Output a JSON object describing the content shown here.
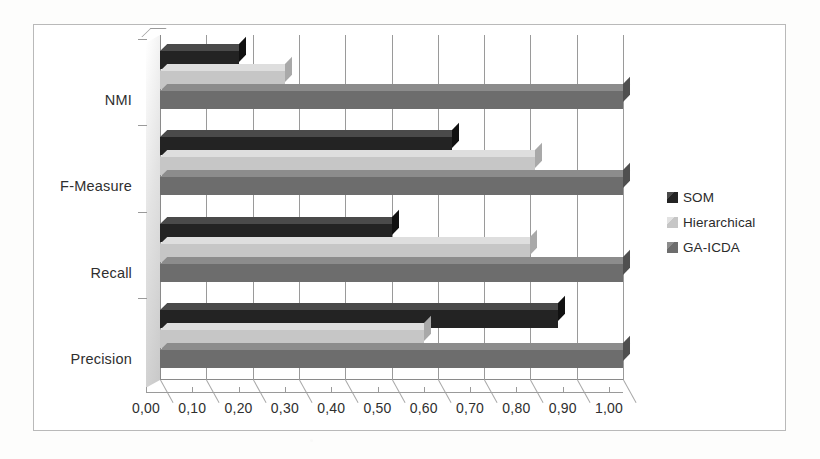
{
  "chart_data": {
    "type": "bar",
    "orientation": "horizontal",
    "title": "",
    "xlabel": "",
    "ylabel": "",
    "categories": [
      "Precision",
      "Recall",
      "F-Measure",
      "NMI"
    ],
    "series": [
      {
        "name": "SOM",
        "color": "#232323",
        "values": [
          0.86,
          0.5,
          0.63,
          0.17
        ]
      },
      {
        "name": "Hierarchical",
        "color": "#c6c6c6",
        "values": [
          0.57,
          0.8,
          0.81,
          0.27
        ]
      },
      {
        "name": "GA-ICDA",
        "color": "#6d6d6d",
        "values": [
          1.0,
          1.0,
          1.0,
          1.0
        ]
      }
    ],
    "xlim": [
      0.0,
      1.0
    ],
    "xticks": [
      0.0,
      0.1,
      0.2,
      0.3,
      0.4,
      0.5,
      0.6,
      0.7,
      0.8,
      0.9,
      1.0
    ],
    "xtick_labels": [
      "0,00",
      "0,10",
      "0,20",
      "0,30",
      "0,40",
      "0,50",
      "0,60",
      "0,70",
      "0,80",
      "0,90",
      "1,00"
    ],
    "grid": "vertical",
    "legend_position": "right",
    "style": "3d-bar"
  },
  "legend": {
    "items": [
      {
        "label": "SOM"
      },
      {
        "label": "Hierarchical"
      },
      {
        "label": "GA-ICDA"
      }
    ]
  },
  "axis": {
    "category_labels": [
      "NMI",
      "F-Measure",
      "Recall",
      "Precision"
    ],
    "value_labels": [
      "0,00",
      "0,10",
      "0,20",
      "0,30",
      "0,40",
      "0,50",
      "0,60",
      "0,70",
      "0,80",
      "0,90",
      "1,00"
    ]
  }
}
